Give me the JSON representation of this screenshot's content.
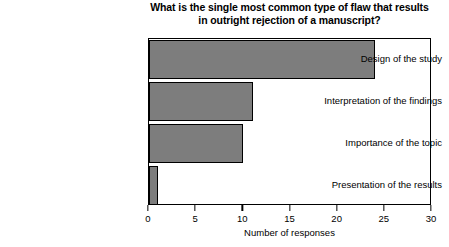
{
  "chart_data": {
    "type": "bar",
    "orientation": "horizontal",
    "title": "What is the single most common type of flaw that results in outright rejection of a manuscript?",
    "title_lines": [
      "What is the single most common type of flaw that results",
      "in outright rejection of a manuscript?"
    ],
    "categories": [
      "Design of the study",
      "Interpretation of the findings",
      "Importance of the topic",
      "Presentation of the results"
    ],
    "values": [
      24,
      11,
      10,
      1
    ],
    "xlabel": "Number of responses",
    "ylabel": "",
    "xlim": [
      0,
      30
    ],
    "xticks": [
      0,
      5,
      10,
      15,
      20,
      25,
      30
    ],
    "xtick_labels": [
      "0",
      "5",
      "10",
      "15",
      "20",
      "25",
      "30"
    ],
    "grid": false,
    "legend": null,
    "bar_color": "#7d7d7d",
    "bar_border_color": "#000000",
    "frame_color": "#000000",
    "plot_background": "#ffffff"
  }
}
